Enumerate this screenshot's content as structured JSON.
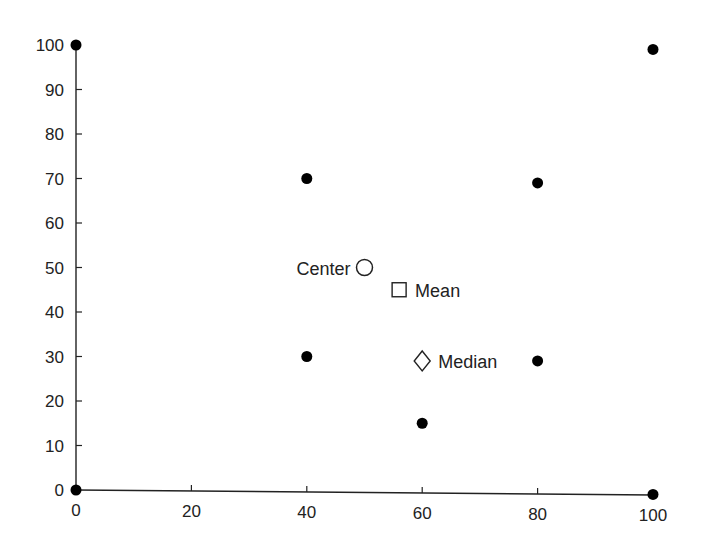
{
  "chart_data": {
    "type": "scatter",
    "title": "",
    "xlabel": "",
    "ylabel": "",
    "xlim": [
      0,
      100
    ],
    "ylim": [
      0,
      100
    ],
    "grid": false,
    "x_ticks": [
      "0",
      "20",
      "40",
      "60",
      "80",
      "100"
    ],
    "y_ticks": [
      "0",
      "10",
      "20",
      "30",
      "40",
      "50",
      "60",
      "70",
      "80",
      "90",
      "100"
    ],
    "series": [
      {
        "name": "points",
        "marker": "filled-circle",
        "points": [
          {
            "x": 0,
            "y": 100
          },
          {
            "x": 100,
            "y": 99
          },
          {
            "x": 40,
            "y": 70
          },
          {
            "x": 80,
            "y": 69
          },
          {
            "x": 40,
            "y": 30
          },
          {
            "x": 80,
            "y": 29
          },
          {
            "x": 60,
            "y": 15
          },
          {
            "x": 0,
            "y": 0
          },
          {
            "x": 100,
            "y": -1
          }
        ]
      }
    ],
    "annotations": [
      {
        "label": "Center",
        "marker": "open-circle",
        "x": 50,
        "y": 50,
        "label_side": "left"
      },
      {
        "label": "Mean",
        "marker": "open-square",
        "x": 56,
        "y": 45,
        "label_side": "right"
      },
      {
        "label": "Median",
        "marker": "open-diamond",
        "x": 60,
        "y": 29,
        "label_side": "right"
      }
    ]
  }
}
